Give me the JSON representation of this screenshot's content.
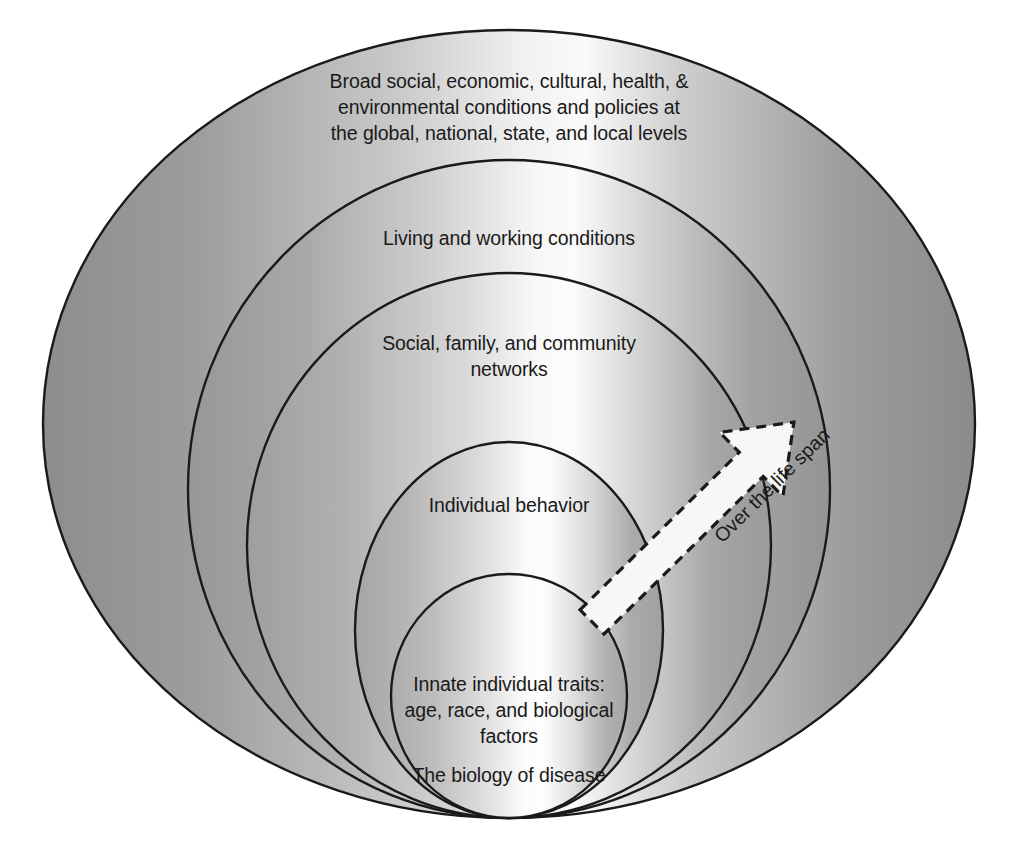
{
  "diagram": {
    "type": "nested-ellipse-layers",
    "background_color": "#ffffff",
    "outline_color": "#1a1a1a",
    "fill_light": "#f4f4f4",
    "fill_dark": "#8e8e8e",
    "layers": [
      {
        "id": "ring-1",
        "order": 1,
        "label": "Broad social, economic, cultural, health, &\nenvironmental conditions and policies at\nthe global, national, state, and local levels"
      },
      {
        "id": "ring-2",
        "order": 2,
        "label": "Living and working conditions"
      },
      {
        "id": "ring-3",
        "order": 3,
        "label": "Social, family, and community\nnetworks"
      },
      {
        "id": "ring-4",
        "order": 4,
        "label": "Individual behavior"
      },
      {
        "id": "ring-5",
        "order": 5,
        "label": "Innate individual traits:\nage, race, and biological\nfactors",
        "sublabel": "The biology of disease"
      }
    ],
    "arrow": {
      "label": "Over the life span",
      "direction": "up-right",
      "fill_color": "#f7f7f5",
      "border_style": "dashed",
      "border_color": "#1a1a1a"
    }
  }
}
